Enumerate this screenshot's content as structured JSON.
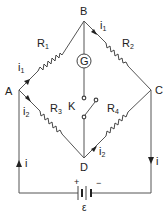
{
  "diagram": {
    "nodes": {
      "A": "A",
      "B": "B",
      "C": "C",
      "D": "D"
    },
    "resistors": [
      {
        "id": "R1",
        "main": "R",
        "sub": "1",
        "between": "A-B"
      },
      {
        "id": "R2",
        "main": "R",
        "sub": "2",
        "between": "B-C"
      },
      {
        "id": "R3",
        "main": "R",
        "sub": "3",
        "between": "A-D"
      },
      {
        "id": "R4",
        "main": "R",
        "sub": "4",
        "between": "D-C"
      }
    ],
    "galvanometer": {
      "label": "G",
      "between": "B-D"
    },
    "key": {
      "label": "K",
      "between": "B-D"
    },
    "battery": {
      "emf_label": "ε",
      "plus": "+",
      "minus": "−"
    },
    "currents": {
      "i1_AB": {
        "main": "i",
        "sub": "1"
      },
      "i1_BC": {
        "main": "i",
        "sub": "1"
      },
      "i2_AD": {
        "main": "i",
        "sub": "2"
      },
      "i2_DC": {
        "main": "i",
        "sub": "2"
      },
      "i_left": "i",
      "i_right": "i"
    },
    "colors": {
      "wire": "#555555",
      "text": "#222222",
      "background": "#ffffff"
    }
  }
}
